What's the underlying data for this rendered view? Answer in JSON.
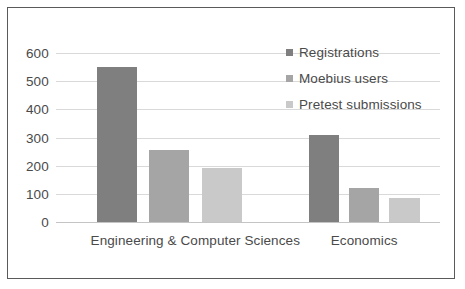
{
  "chart_data": {
    "type": "bar",
    "title": "",
    "xlabel": "",
    "ylabel": "",
    "categories": [
      "Engineering & Computer Sciences",
      "Economics"
    ],
    "series": [
      {
        "name": "Registrations",
        "values": [
          550,
          310
        ],
        "color": "#7f7f7f"
      },
      {
        "name": "Moebius users",
        "values": [
          255,
          120
        ],
        "color": "#a5a5a5"
      },
      {
        "name": "Pretest submissions",
        "values": [
          190,
          85
        ],
        "color": "#c9c9c9"
      }
    ],
    "ylim": [
      0,
      600
    ],
    "yticks": [
      600,
      500,
      400,
      300,
      200,
      100,
      0
    ],
    "ytick_labels": [
      "600",
      "500",
      "400",
      "300",
      "200",
      "100",
      "0"
    ],
    "grid": true,
    "legend_position": "top-right",
    "frame_color": "#5a5a5a",
    "gridline_color": "#d9d9d9",
    "text_color": "#4a4a4a",
    "background": "#ffffff"
  }
}
